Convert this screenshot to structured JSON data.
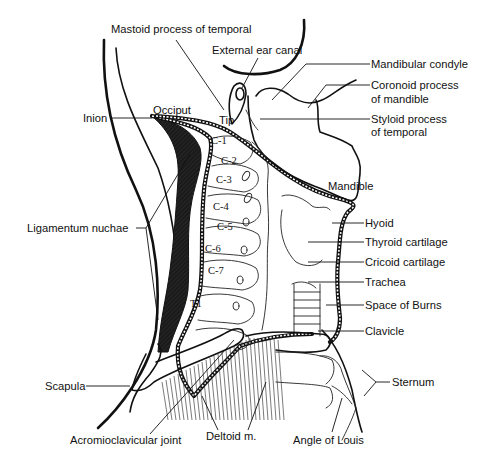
{
  "diagram": {
    "labels": {
      "mastoid": "Mastoid process of temporal",
      "ear_canal": "External ear canal",
      "mandibular_condyle": "Mandibular condyle",
      "coronoid_1": "Coronoid process",
      "coronoid_2": "of mandible",
      "styloid_1": "Styloid process",
      "styloid_2": "of temporal",
      "inion": "Inion",
      "occiput": "Occiput",
      "tip": "Tip",
      "mandible": "Mandible",
      "ligamentum_nuchae": "Ligamentum nuchae",
      "hyoid": "Hyoid",
      "thyroid_cartilage": "Thyroid cartilage",
      "cricoid_cartilage": "Cricoid cartilage",
      "trachea": "Trachea",
      "space_of_burns": "Space of Burns",
      "clavicle": "Clavicle",
      "scapula": "Scapula",
      "sternum": "Sternum",
      "acromioclavicular_joint": "Acromioclavicular joint",
      "deltoid": "Deltoid m.",
      "angle_of_louis": "Angle of Louis"
    },
    "vertebrae": [
      "C-1",
      "C-2",
      "C-3",
      "C-4",
      "C-5",
      "C-6",
      "C-7",
      "T1"
    ],
    "colors": {
      "line": "#111111",
      "background": "#ffffff",
      "ligament_fill": "#1a1a1a"
    }
  }
}
